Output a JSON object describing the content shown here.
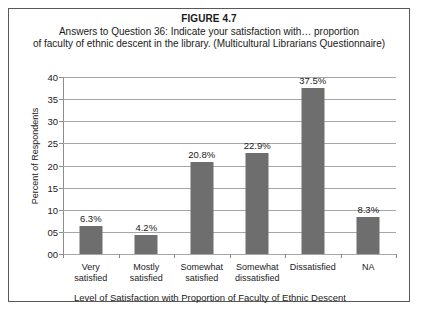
{
  "figure": {
    "number_label": "FIGURE 4.7",
    "caption_line_1": "Answers to Question 36: Indicate your satisfaction with… proportion",
    "caption_line_2": "of faculty of ethnic descent in the library. (Multicultural Librarians Questionnaire)"
  },
  "colors": {
    "bar_fill": "#6e6e6e",
    "gridline": "#a6a6a6",
    "axis_line": "#8c8c8c",
    "frame_border": "#595959",
    "background": "#ffffff",
    "text": "#1a1a1a"
  },
  "chart_data": {
    "type": "bar",
    "title": "FIGURE 4.7",
    "subtitle": "Answers to Question 36: Indicate your satisfaction with… proportion of faculty of ethnic descent in the library. (Multicultural Librarians Questionnaire)",
    "xlabel": "Level of Satisfaction with Proportion of Faculty of Ethnic Descent",
    "ylabel": "Percent of Respondents",
    "categories": [
      "Very satisfied",
      "Mostly satisfied",
      "Somewhat satisfied",
      "Somewhat dissatisfied",
      "Dissatisfied",
      "NA"
    ],
    "category_lines": [
      [
        "Very",
        "satisfied"
      ],
      [
        "Mostly",
        "satisfied"
      ],
      [
        "Somewhat",
        "satisfied"
      ],
      [
        "Somewhat",
        "dissatisfied"
      ],
      [
        "Dissatisfied",
        ""
      ],
      [
        "NA",
        ""
      ]
    ],
    "values": [
      6.3,
      4.2,
      20.8,
      22.9,
      37.5,
      8.3
    ],
    "data_labels": [
      "6.3%",
      "4.2%",
      "20.8%",
      "22.9%",
      "37.5%",
      "8.3%"
    ],
    "ylim": [
      0,
      40
    ],
    "ytick_values": [
      0,
      5,
      10,
      15,
      20,
      25,
      30,
      35,
      40
    ],
    "ytick_labels": [
      "00",
      "05",
      "10",
      "15",
      "20",
      "25",
      "30",
      "35",
      "40"
    ],
    "grid": true,
    "grid_axis": "y",
    "legend": false,
    "legend_position": "none"
  }
}
